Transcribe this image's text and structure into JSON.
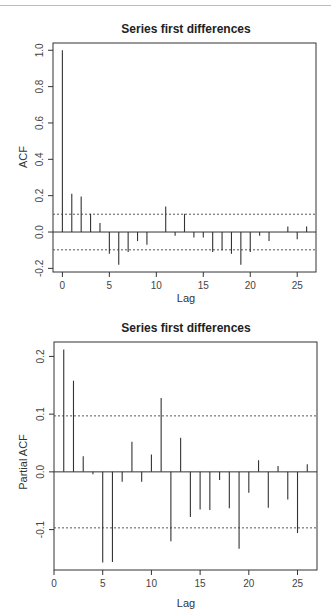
{
  "chart_data": [
    {
      "type": "bar",
      "subtype": "acf-correlogram",
      "title": "Series  first differences",
      "xlabel": "Lag",
      "ylabel": "ACF",
      "x": [
        0,
        1,
        2,
        3,
        4,
        5,
        6,
        7,
        8,
        9,
        10,
        11,
        12,
        13,
        14,
        15,
        16,
        17,
        18,
        19,
        20,
        21,
        22,
        23,
        24,
        25,
        26
      ],
      "values": [
        1.0,
        0.21,
        0.195,
        0.1,
        0.05,
        -0.12,
        -0.18,
        -0.11,
        -0.05,
        -0.07,
        0.0,
        0.14,
        -0.02,
        0.1,
        -0.03,
        -0.03,
        -0.11,
        -0.1,
        -0.12,
        -0.18,
        -0.11,
        -0.02,
        -0.05,
        0.0,
        0.03,
        -0.04,
        0.03
      ],
      "confidence_bounds": [
        0.098,
        -0.098
      ],
      "xlim": [
        -1,
        27
      ],
      "ylim": [
        -0.22,
        1.04
      ],
      "xticks": [
        0,
        5,
        10,
        15,
        20,
        25
      ],
      "yticks": [
        -0.2,
        0.0,
        0.2,
        0.4,
        0.6,
        0.8,
        1.0
      ],
      "ytick_labels": [
        "-0.2",
        "0.0",
        "0.2",
        "0.4",
        "0.6",
        "0.8",
        "1.0"
      ],
      "grid": false
    },
    {
      "type": "bar",
      "subtype": "pacf-correlogram",
      "title": "Series  first differences",
      "xlabel": "Lag",
      "ylabel": "Partial ACF",
      "x": [
        1,
        2,
        3,
        4,
        5,
        6,
        7,
        8,
        9,
        10,
        11,
        12,
        13,
        14,
        15,
        16,
        17,
        18,
        19,
        20,
        21,
        22,
        23,
        24,
        25,
        26
      ],
      "values": [
        0.212,
        0.158,
        0.027,
        -0.004,
        -0.157,
        -0.156,
        -0.017,
        0.052,
        -0.017,
        0.03,
        0.128,
        -0.12,
        0.059,
        -0.078,
        -0.065,
        -0.066,
        -0.014,
        -0.063,
        -0.133,
        -0.036,
        0.02,
        -0.062,
        0.01,
        -0.048,
        -0.106,
        0.013
      ],
      "confidence_bounds": [
        0.097,
        -0.097
      ],
      "xlim": [
        0,
        27
      ],
      "ylim": [
        -0.17,
        0.225
      ],
      "xticks": [
        0,
        5,
        10,
        15,
        20,
        25
      ],
      "yticks": [
        -0.1,
        0.0,
        0.1,
        0.2
      ],
      "ytick_labels": [
        "-0.1",
        "0.0",
        "0.1",
        "0.2"
      ],
      "grid": false
    }
  ]
}
